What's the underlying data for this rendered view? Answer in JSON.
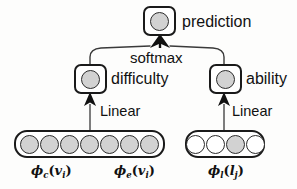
{
  "diagram": {
    "colors": {
      "stroke": "#1a1a1a",
      "filled_unit": "#d2d2d2",
      "empty_unit": "#ffffff",
      "background": "#fdfdfc"
    },
    "nodes": {
      "prediction": {
        "label": "prediction",
        "unit_state": "filled"
      },
      "difficulty": {
        "label": "difficulty",
        "unit_state": "filled"
      },
      "ability": {
        "label": "ability",
        "unit_state": "filled"
      }
    },
    "edges": {
      "softmax_label": "softmax",
      "linear_left_label": "Linear",
      "linear_right_label": "Linear"
    },
    "vectors": {
      "left": {
        "units": [
          "filled",
          "filled",
          "filled",
          "filled",
          "filled",
          "filled",
          "filled"
        ],
        "labels": [
          {
            "symbol": "ϕ",
            "sub": "c",
            "arg": "v",
            "arg_sub": "i"
          },
          {
            "symbol": "ϕ",
            "sub": "e",
            "arg": "v",
            "arg_sub": "i"
          }
        ]
      },
      "right": {
        "units": [
          "empty",
          "empty",
          "filled",
          "empty"
        ],
        "labels": [
          {
            "symbol": "ϕ",
            "sub": "l",
            "arg": "l",
            "arg_sub": "j"
          }
        ]
      }
    }
  }
}
